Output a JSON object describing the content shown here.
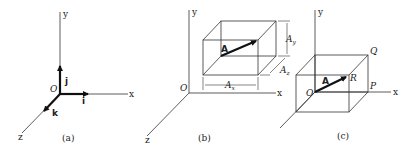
{
  "panels": [
    {
      "caption": "(a)",
      "axes": {
        "x": "x",
        "y": "y",
        "z": "z",
        "origin": "O"
      },
      "unit_vectors": {
        "i": "i",
        "j": "j",
        "k": "k"
      }
    },
    {
      "caption": "(b)",
      "axes": {
        "x": "x",
        "y": "y",
        "z": "z",
        "origin": "O"
      },
      "vector": "A",
      "components": {
        "ax": "A",
        "ax_sub": "x",
        "ay": "A",
        "ay_sub": "y",
        "az": "A",
        "az_sub": "z"
      }
    },
    {
      "caption": "(c)",
      "axes": {
        "x": "x",
        "y": "y",
        "z": "z",
        "origin": "O"
      },
      "vector": "A",
      "points": {
        "P": "P",
        "Q": "Q",
        "R": "R"
      }
    }
  ]
}
